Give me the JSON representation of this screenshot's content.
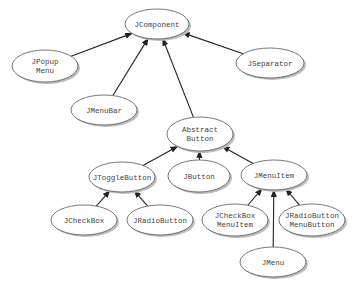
{
  "diagram": {
    "nodes": [
      {
        "id": "jcomponent",
        "lines": [
          "JComponent"
        ],
        "cx": 157,
        "cy": 24,
        "rx": 32,
        "ry": 15
      },
      {
        "id": "jpopupmenu",
        "lines": [
          "JPopup",
          "Menu"
        ],
        "cx": 45,
        "cy": 66,
        "rx": 33,
        "ry": 16
      },
      {
        "id": "jmenubar",
        "lines": [
          "JMenuBar"
        ],
        "cx": 104,
        "cy": 110,
        "rx": 33,
        "ry": 15
      },
      {
        "id": "jseparator",
        "lines": [
          "JSeparator"
        ],
        "cx": 270,
        "cy": 63,
        "rx": 34,
        "ry": 15
      },
      {
        "id": "abstractbutton",
        "lines": [
          "Abstract",
          "Button"
        ],
        "cx": 200,
        "cy": 134,
        "rx": 33,
        "ry": 17
      },
      {
        "id": "jtogglebutton",
        "lines": [
          "JToggleButton"
        ],
        "cx": 122,
        "cy": 177,
        "rx": 33,
        "ry": 15
      },
      {
        "id": "jbutton",
        "lines": [
          "JButton"
        ],
        "cx": 199,
        "cy": 176,
        "rx": 31,
        "ry": 16
      },
      {
        "id": "jmenuitem",
        "lines": [
          "JMenuItem"
        ],
        "cx": 274,
        "cy": 175,
        "rx": 33,
        "ry": 15
      },
      {
        "id": "jcheckbox",
        "lines": [
          "JCheckBox"
        ],
        "cx": 84,
        "cy": 220,
        "rx": 33,
        "ry": 15
      },
      {
        "id": "jradiobutton",
        "lines": [
          "JRadioButton"
        ],
        "cx": 160,
        "cy": 220,
        "rx": 33,
        "ry": 15
      },
      {
        "id": "jcheckboxmenuitem",
        "lines": [
          "JCheckBox",
          "MenuItem"
        ],
        "cx": 235,
        "cy": 220,
        "rx": 33,
        "ry": 16
      },
      {
        "id": "jradiobuttonmenubutton",
        "lines": [
          "JRadioButton",
          "MenuButton"
        ],
        "cx": 312,
        "cy": 220,
        "rx": 33,
        "ry": 16
      },
      {
        "id": "jmenu",
        "lines": [
          "JMenu"
        ],
        "cx": 273,
        "cy": 262,
        "rx": 33,
        "ry": 15
      }
    ],
    "edges": [
      {
        "from": "jpopupmenu",
        "to": "jcomponent"
      },
      {
        "from": "jmenubar",
        "to": "jcomponent"
      },
      {
        "from": "jseparator",
        "to": "jcomponent"
      },
      {
        "from": "abstractbutton",
        "to": "jcomponent"
      },
      {
        "from": "jtogglebutton",
        "to": "abstractbutton"
      },
      {
        "from": "jbutton",
        "to": "abstractbutton"
      },
      {
        "from": "jmenuitem",
        "to": "abstractbutton"
      },
      {
        "from": "jcheckbox",
        "to": "jtogglebutton"
      },
      {
        "from": "jradiobutton",
        "to": "jtogglebutton"
      },
      {
        "from": "jcheckboxmenuitem",
        "to": "jmenuitem"
      },
      {
        "from": "jradiobuttonmenubutton",
        "to": "jmenuitem"
      },
      {
        "from": "jmenu",
        "to": "jmenuitem"
      }
    ],
    "colors": {
      "edge": "#222222",
      "node_fill": "#ffffff",
      "node_stroke": "#555555",
      "shadow": "#bdbdbd",
      "text": "#444444"
    }
  }
}
